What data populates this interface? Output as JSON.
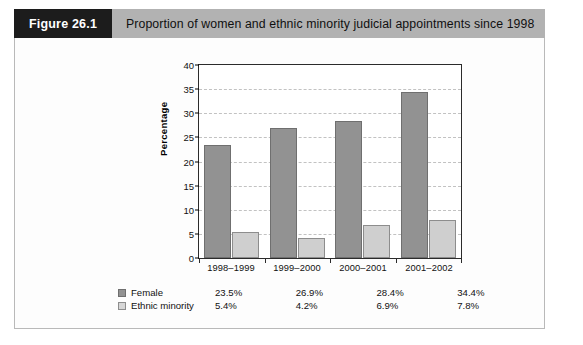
{
  "figure": {
    "tag": "Figure 26.1",
    "title": "Proportion of women and ethnic minority judicial appointments since 1998"
  },
  "colors": {
    "female_bar": "#929292",
    "ethnic_bar": "#cfcfcf",
    "banner_tag_bg": "#1c1c1c",
    "banner_title_bg": "#b2b2b2",
    "gridline": "#c2c2c2",
    "axis": "#2b2b2b"
  },
  "chart_data": {
    "type": "bar",
    "title": "Proportion of women and ethnic minority judicial appointments since 1998",
    "xlabel": "",
    "ylabel": "Percentage",
    "categories": [
      "1998–1999",
      "1999–2000",
      "2000–2001",
      "2001–2002"
    ],
    "series": [
      {
        "name": "Female",
        "values": [
          23.5,
          26.9,
          28.4,
          34.4
        ],
        "labels": [
          "23.5%",
          "26.9%",
          "28.4%",
          "34.4%"
        ],
        "color": "#929292"
      },
      {
        "name": "Ethnic minority",
        "values": [
          5.4,
          4.2,
          6.9,
          7.8
        ],
        "labels": [
          "5.4%",
          "4.2%",
          "6.9%",
          "7.8%"
        ],
        "color": "#cfcfcf"
      }
    ],
    "ylim": [
      0,
      40
    ],
    "yticks": [
      0,
      5,
      10,
      15,
      20,
      25,
      30,
      35,
      40
    ],
    "ytick_labels": [
      "0",
      "5",
      "10",
      "15",
      "20",
      "25",
      "30",
      "35",
      "40"
    ],
    "grid": true,
    "grid_axis": "y",
    "legend_position": "bottom-left"
  }
}
